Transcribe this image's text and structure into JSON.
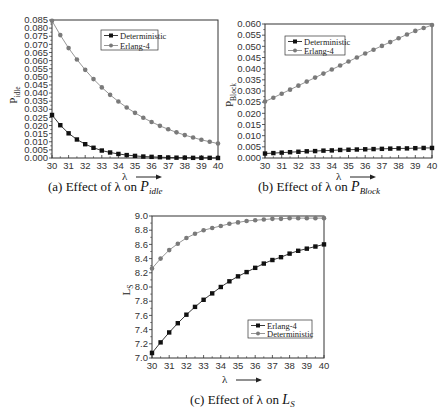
{
  "figure": {
    "panels": [
      {
        "id": "a",
        "caption_prefix": "(a) Effect of λ on ",
        "caption_var": "P",
        "caption_sub": "idle",
        "ylabel_main": "P",
        "ylabel_sub": "idle",
        "xlabel": "λ"
      },
      {
        "id": "b",
        "caption_prefix": "(b)  Effect of λ on ",
        "caption_var": "P",
        "caption_sub": "Block",
        "ylabel_main": "P",
        "ylabel_sub": "Block",
        "xlabel": "λ"
      },
      {
        "id": "c",
        "caption_prefix": "(c) Effect of λ on ",
        "caption_var": "L",
        "caption_sub": "S",
        "ylabel_main": "L",
        "ylabel_sub": "S",
        "xlabel": "λ"
      }
    ]
  },
  "chart_data": [
    {
      "type": "line",
      "title": "(a) Effect of λ on P_idle",
      "xlabel": "λ",
      "ylabel": "P_idle",
      "xlim": [
        30,
        40
      ],
      "ylim": [
        0.0,
        0.085
      ],
      "xticks": [
        30,
        31,
        32,
        33,
        34,
        35,
        36,
        37,
        38,
        39,
        40
      ],
      "yticks": [
        0.0,
        0.005,
        0.01,
        0.015,
        0.02,
        0.025,
        0.03,
        0.035,
        0.04,
        0.045,
        0.05,
        0.055,
        0.06,
        0.065,
        0.07,
        0.075,
        0.08,
        0.085
      ],
      "ytick_labels": [
        "0.000",
        "0.005",
        "0.010",
        "0.015",
        "0.020",
        "0.025",
        "0.030",
        "0.035",
        "0.040",
        "0.045",
        "0.050",
        "0.055",
        "0.060",
        "0.065",
        "0.070",
        "0.075",
        "0.080",
        "0.085"
      ],
      "grid": false,
      "legend_position": "upper center",
      "x": [
        30,
        30.5,
        31,
        31.5,
        32,
        32.5,
        33,
        33.5,
        34,
        34.5,
        35,
        35.5,
        36,
        36.5,
        37,
        37.5,
        38,
        38.5,
        39,
        39.5,
        40
      ],
      "series": [
        {
          "name": "Deterministic",
          "marker": "square",
          "color": "#111111",
          "values": [
            0.0265,
            0.0202,
            0.0152,
            0.0114,
            0.0085,
            0.0063,
            0.0046,
            0.0034,
            0.0025,
            0.0018,
            0.0013,
            0.0009,
            0.0007,
            0.0005,
            0.0003,
            0.0002,
            0.0002,
            0.0001,
            0.0001,
            0.0001,
            0.0
          ]
        },
        {
          "name": "Erlang-4",
          "marker": "circle",
          "color": "#7a7a7a",
          "values": [
            0.0845,
            0.0757,
            0.0677,
            0.0607,
            0.0543,
            0.0486,
            0.0435,
            0.0389,
            0.0348,
            0.0311,
            0.0278,
            0.0248,
            0.0222,
            0.0198,
            0.0177,
            0.0158,
            0.0141,
            0.0126,
            0.0112,
            0.01,
            0.0089
          ]
        }
      ]
    },
    {
      "type": "line",
      "title": "(b) Effect of λ on P_Block",
      "xlabel": "λ",
      "ylabel": "P_Block",
      "xlim": [
        30,
        40
      ],
      "ylim": [
        0.0,
        0.06
      ],
      "xticks": [
        30,
        31,
        32,
        33,
        34,
        35,
        36,
        37,
        38,
        39,
        40
      ],
      "yticks": [
        0.0,
        0.005,
        0.01,
        0.015,
        0.02,
        0.025,
        0.03,
        0.035,
        0.04,
        0.045,
        0.05,
        0.055,
        0.06
      ],
      "ytick_labels": [
        "0.000",
        "0.005",
        "0.010",
        "0.015",
        "0.020",
        "0.025",
        "0.030",
        "0.035",
        "0.040",
        "0.045",
        "0.050",
        "0.055",
        "0.060"
      ],
      "grid": false,
      "legend_position": "upper left",
      "x": [
        30,
        30.5,
        31,
        31.5,
        32,
        32.5,
        33,
        33.5,
        34,
        34.5,
        35,
        35.5,
        36,
        36.5,
        37,
        37.5,
        38,
        38.5,
        39,
        39.5,
        40
      ],
      "series": [
        {
          "name": "Deterministic",
          "marker": "square",
          "color": "#111111",
          "values": [
            0.002,
            0.0022,
            0.0024,
            0.0026,
            0.0028,
            0.003,
            0.0031,
            0.0033,
            0.0034,
            0.0036,
            0.0037,
            0.0038,
            0.0039,
            0.004,
            0.0041,
            0.0042,
            0.0043,
            0.0043,
            0.0044,
            0.0045,
            0.0045
          ]
        },
        {
          "name": "Erlang-4",
          "marker": "circle",
          "color": "#7a7a7a",
          "values": [
            0.0253,
            0.027,
            0.0288,
            0.0306,
            0.0324,
            0.0342,
            0.036,
            0.0378,
            0.0396,
            0.0414,
            0.0432,
            0.045,
            0.0468,
            0.0485,
            0.0502,
            0.0519,
            0.0536,
            0.0553,
            0.0569,
            0.0582,
            0.0595
          ]
        }
      ]
    },
    {
      "type": "line",
      "title": "(c) Effect of λ on L_S",
      "xlabel": "λ",
      "ylabel": "L_S",
      "xlim": [
        30,
        40
      ],
      "ylim": [
        7.0,
        9.0
      ],
      "xticks": [
        30,
        31,
        32,
        33,
        34,
        35,
        36,
        37,
        38,
        39,
        40
      ],
      "yticks": [
        7.0,
        7.2,
        7.4,
        7.6,
        7.8,
        8.0,
        8.2,
        8.4,
        8.6,
        8.8,
        9.0
      ],
      "ytick_labels": [
        "7.0",
        "7.2",
        "7.4",
        "7.6",
        "7.8",
        "8.0",
        "8.2",
        "8.4",
        "8.6",
        "8.8",
        "9.0"
      ],
      "grid": false,
      "legend_position": "lower right",
      "x": [
        30,
        30.5,
        31,
        31.5,
        32,
        32.5,
        33,
        33.5,
        34,
        34.5,
        35,
        35.5,
        36,
        36.5,
        37,
        37.5,
        38,
        38.5,
        39,
        39.5,
        40
      ],
      "series": [
        {
          "name": "Erlang-4",
          "marker": "square",
          "color": "#111111",
          "values": [
            7.07,
            7.22,
            7.36,
            7.49,
            7.61,
            7.72,
            7.82,
            7.91,
            8.0,
            8.08,
            8.15,
            8.21,
            8.27,
            8.33,
            8.38,
            8.42,
            8.47,
            8.51,
            8.54,
            8.57,
            8.6
          ]
        },
        {
          "name": "Deterministic",
          "marker": "circle",
          "color": "#7a7a7a",
          "values": [
            8.26,
            8.4,
            8.52,
            8.61,
            8.69,
            8.75,
            8.8,
            8.83,
            8.86,
            8.89,
            8.91,
            8.93,
            8.94,
            8.95,
            8.96,
            8.96,
            8.97,
            8.97,
            8.97,
            8.97,
            8.97
          ]
        }
      ]
    }
  ]
}
